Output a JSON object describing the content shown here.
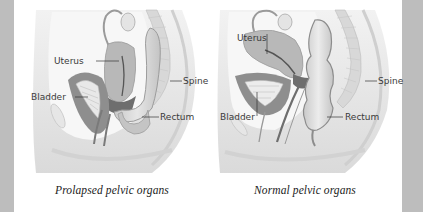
{
  "colors": {
    "side_bar": "#bdbdbd",
    "background": "#ffffff",
    "tissue": "#e3e3e3",
    "organ_dark": "#8a8a8a",
    "organ_mid": "#b4b4b4",
    "organ_light": "#d6d6d6",
    "label_text": "#3a3a3a"
  },
  "diagrams": [
    {
      "id": "prolapsed",
      "caption": "Prolapsed pelvic organs",
      "labels": {
        "uterus": "Uterus",
        "bladder": "Bladder",
        "spine": "Spine",
        "rectum": "Rectum"
      }
    },
    {
      "id": "normal",
      "caption": "Normal pelvic organs",
      "labels": {
        "uterus": "Uterus",
        "bladder": "Bladder",
        "spine": "Spine",
        "rectum": "Rectum"
      }
    }
  ]
}
